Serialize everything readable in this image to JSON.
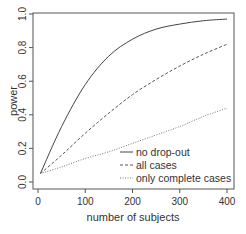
{
  "chart_data": {
    "type": "line",
    "title": "",
    "xlabel": "number of subjects",
    "ylabel": "power",
    "xlim": [
      0,
      400
    ],
    "ylim": [
      0,
      1
    ],
    "x_ticks": [
      "0",
      "100",
      "200",
      "300",
      "400"
    ],
    "y_ticks": [
      "0.0",
      "0.2",
      "0.4",
      "0.6",
      "0.8",
      "1.0"
    ],
    "grid": false,
    "legend_position": "bottom-right",
    "x": [
      5,
      50,
      100,
      150,
      200,
      250,
      300,
      350,
      400
    ],
    "series": [
      {
        "name": "no drop-out",
        "style": "solid",
        "values": [
          0.05,
          0.33,
          0.58,
          0.75,
          0.85,
          0.91,
          0.94,
          0.96,
          0.97
        ]
      },
      {
        "name": "all cases",
        "style": "dashed",
        "values": [
          0.05,
          0.16,
          0.29,
          0.41,
          0.52,
          0.61,
          0.69,
          0.76,
          0.82
        ]
      },
      {
        "name": "only complete cases",
        "style": "dotted",
        "values": [
          0.05,
          0.09,
          0.14,
          0.18,
          0.23,
          0.28,
          0.33,
          0.39,
          0.44
        ]
      }
    ]
  }
}
